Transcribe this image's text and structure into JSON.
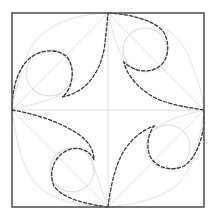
{
  "diagram": {
    "type": "geometric-construction",
    "colors": {
      "frame": "#555555",
      "guides": "#dcdcdc",
      "circles": "#d6d6d6",
      "dashed_curves": "#333333",
      "background": "#ffffff"
    },
    "frame": {
      "x": 12,
      "y": 13,
      "width": 192,
      "height": 194
    },
    "center": {
      "x": 108,
      "y": 110
    },
    "vertices": {
      "top": {
        "x": 108,
        "y": 13
      },
      "right": {
        "x": 204,
        "y": 110
      },
      "bottom": {
        "x": 108,
        "y": 207
      },
      "left": {
        "x": 12,
        "y": 110
      }
    },
    "circles": [
      {
        "name": "top-left",
        "cx": 49,
        "cy": 73,
        "r": 23
      },
      {
        "name": "top-right",
        "cx": 145,
        "cy": 50,
        "r": 22
      },
      {
        "name": "bottom-left",
        "cx": 72,
        "cy": 170,
        "r": 22
      },
      {
        "name": "bottom-right",
        "cx": 168,
        "cy": 147,
        "r": 22
      }
    ]
  }
}
